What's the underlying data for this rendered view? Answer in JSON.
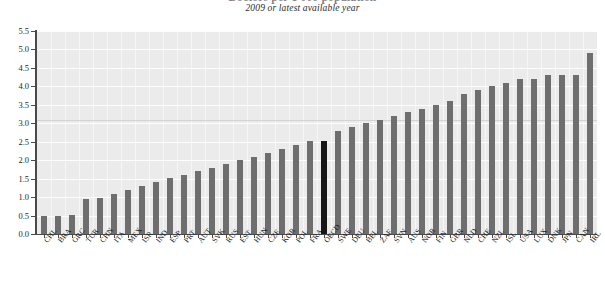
{
  "chart_data": {
    "type": "bar",
    "title": "Doctors per 1 000 population",
    "subtitle": "2009 or latest available year",
    "xlabel": "",
    "ylabel": "",
    "ylim": [
      0.0,
      5.5
    ],
    "ytick_step": 0.5,
    "ytick_labels": [
      "0.0",
      "0.5",
      "1.0",
      "1.5",
      "2.0",
      "2.5",
      "3.0",
      "3.5",
      "4.0",
      "4.5",
      "5.0",
      "5.5"
    ],
    "grid": true,
    "legend": "none",
    "highlight_category": "OECD",
    "colors": {
      "bar": "#6e6e6e",
      "bar_highlight": "#161616",
      "plot_background": "#ebebeb",
      "gridline": "#ffffff",
      "axis": "#4a4a4a",
      "text": "#1c1c1c"
    },
    "categories": [
      "CHL",
      "BRA",
      "GRC",
      "TUR",
      "CHN",
      "ITA",
      "MEX",
      "ISR",
      "IND",
      "ESP",
      "PRT",
      "AUT",
      "SVK",
      "RUS",
      "EST",
      "HUN",
      "CZE",
      "KOR",
      "POL",
      "FRA",
      "OECD",
      "SWE",
      "DEU",
      "BEL",
      "ZAF",
      "SVN",
      "AUS",
      "NOR",
      "FIN",
      "GBR",
      "NLD",
      "CHE",
      "NZL",
      "ISL",
      "USA",
      "LUX",
      "DNK",
      "JPN",
      "CAN",
      "IRL"
    ],
    "values": [
      0.5,
      0.5,
      0.52,
      0.95,
      0.98,
      1.08,
      1.18,
      1.3,
      1.4,
      1.52,
      1.6,
      1.72,
      1.8,
      1.9,
      2.0,
      2.1,
      2.2,
      2.3,
      2.42,
      2.52,
      2.52,
      2.8,
      2.9,
      3.0,
      3.1,
      3.2,
      3.3,
      3.4,
      3.5,
      3.6,
      3.8,
      3.9,
      4.0,
      4.1,
      4.2,
      4.2,
      4.3,
      4.32,
      4.32,
      4.9
    ]
  }
}
